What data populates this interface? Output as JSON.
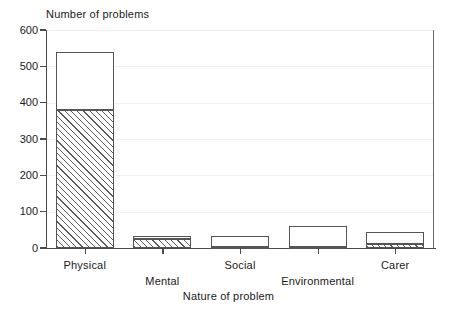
{
  "chart_data": {
    "type": "bar",
    "subtype": "stacked-vertical",
    "title": "",
    "ylabel": "Number of problems",
    "xlabel": "Nature of problem",
    "categories": [
      "Physical",
      "Mental",
      "Social",
      "Environmental",
      "Carer"
    ],
    "series": [
      {
        "name": "hatched",
        "pattern": "diagonal-hatch",
        "values": [
          380,
          26,
          3,
          4,
          11
        ]
      },
      {
        "name": "white",
        "pattern": "solid-white",
        "values": [
          160,
          7,
          29,
          58,
          34
        ]
      }
    ],
    "totals": [
      540,
      33,
      32,
      62,
      45
    ],
    "ylim": [
      0,
      600
    ],
    "yticks": [
      0,
      100,
      200,
      300,
      400,
      500,
      600
    ],
    "ytick_labels": [
      "0",
      "100",
      "200",
      "300",
      "400",
      "500",
      "600"
    ],
    "grid": true,
    "grid_axis": "y",
    "legend": "none",
    "xlabel_layout": "staggered-two-rows",
    "xlabel_rows": [
      0,
      1,
      0,
      1,
      0
    ]
  },
  "colors": {
    "axis": "#4a4a4a",
    "frame": "#6a6a6a",
    "grid": "#f0f0f0",
    "bar_outline": "#555555",
    "hatch": "#5a5a5a",
    "background": "#ffffff",
    "text": "#1a1a1a"
  }
}
